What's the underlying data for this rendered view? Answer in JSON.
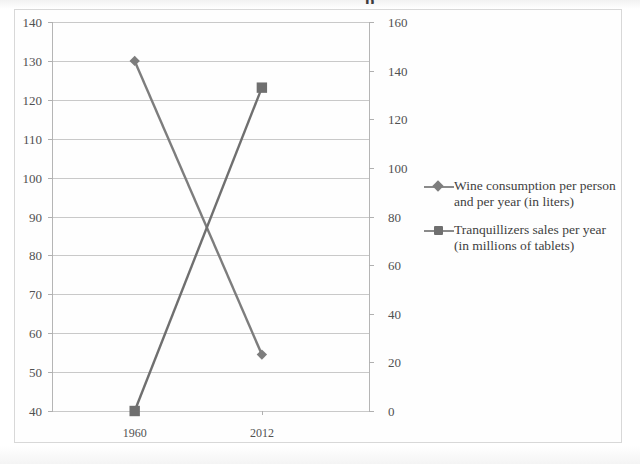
{
  "chart_data": {
    "type": "line",
    "title": "",
    "xlabel": "",
    "categories": [
      "1960",
      "2012"
    ],
    "grid": true,
    "legend_position": "right",
    "axes": {
      "left": {
        "label": "",
        "ylim": [
          40,
          140
        ],
        "ticks": [
          "40",
          "50",
          "60",
          "70",
          "80",
          "90",
          "100",
          "110",
          "120",
          "130",
          "140"
        ]
      },
      "right": {
        "label": "",
        "ylim": [
          0,
          160
        ],
        "ticks": [
          "0",
          "20",
          "40",
          "60",
          "80",
          "100",
          "120",
          "140",
          "160"
        ]
      }
    },
    "series": [
      {
        "name": "Wine consumption per person and per year (in liters)",
        "axis": "left",
        "marker": "diamond",
        "color": "#7d7d7d",
        "values": [
          130,
          54.5
        ]
      },
      {
        "name": "Tranquillizers sales per year (in millions of tablets)",
        "axis": "right",
        "marker": "square",
        "color": "#6f6f6f",
        "values": [
          0,
          133
        ]
      }
    ]
  },
  "title_clipped": "p",
  "legend": {
    "items": [
      {
        "label": "Wine consumption per person and per year (in liters)",
        "marker": "diamond-marker-icon"
      },
      {
        "label": "Tranquillizers sales per year (in millions of tablets)",
        "marker": "square-marker-icon"
      }
    ]
  }
}
